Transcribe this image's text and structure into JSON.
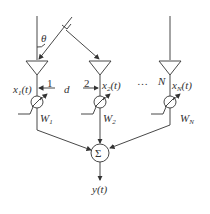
{
  "diagram": {
    "angle_label": "θ",
    "spacing_label": "d",
    "ellipsis": "…",
    "elements": [
      {
        "index_label": "1",
        "signal_base": "x",
        "signal_sub": "1",
        "signal_tail": "(t)",
        "weight_base": "W",
        "weight_sub": "1"
      },
      {
        "index_label": "2",
        "signal_base": "x",
        "signal_sub": "2",
        "signal_tail": "(t)",
        "weight_base": "W",
        "weight_sub": "2"
      },
      {
        "index_label": "N",
        "signal_base": "x",
        "signal_sub": "N",
        "signal_tail": "(t)",
        "weight_base": "W",
        "weight_sub": "N"
      }
    ],
    "summer_symbol": "Σ",
    "output_label": "y(t)",
    "colors": {
      "stroke": "#333333",
      "background": "#ffffff"
    }
  }
}
